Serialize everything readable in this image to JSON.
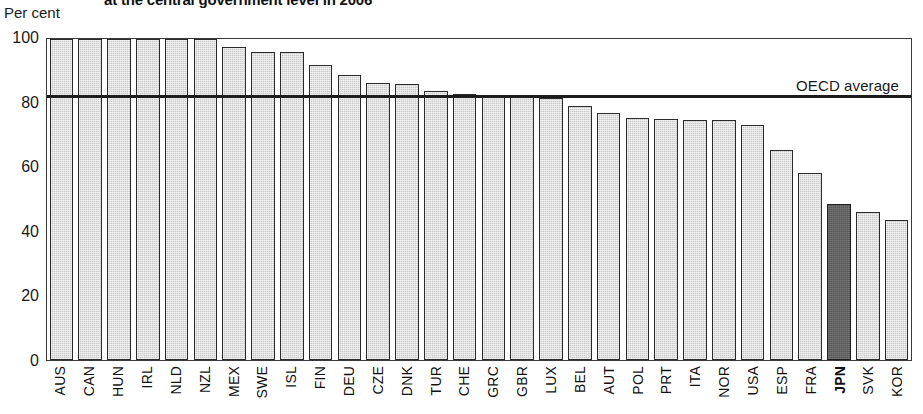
{
  "chart_data": {
    "type": "bar",
    "title": "at the central government level in 2006",
    "units_label": "Per cent",
    "xlabel": "",
    "ylabel": "Per cent",
    "ylim": [
      0,
      100
    ],
    "yticks": [
      0,
      20,
      40,
      60,
      80,
      100
    ],
    "grid": false,
    "legend": "none",
    "highlight_category": "JPN",
    "annotations": [
      {
        "label": "OECD average",
        "type": "reference-line",
        "value": 81.5
      }
    ],
    "categories": [
      "AUS",
      "CAN",
      "HUN",
      "IRL",
      "NLD",
      "NZL",
      "MEX",
      "SWE",
      "ISL",
      "FIN",
      "DEU",
      "CZE",
      "DNK",
      "TUR",
      "CHE",
      "GRC",
      "GBR",
      "LUX",
      "BEL",
      "AUT",
      "POL",
      "PRT",
      "ITA",
      "NOR",
      "USA",
      "ESP",
      "FRA",
      "JPN",
      "SVK",
      "KOR"
    ],
    "values": [
      100,
      100,
      100,
      100,
      100,
      100,
      97.5,
      96.0,
      95.8,
      92.0,
      88.8,
      86.2,
      86.0,
      83.8,
      83.0,
      82.6,
      82.3,
      81.6,
      79.2,
      76.8,
      75.3,
      75.0,
      74.8,
      74.8,
      73.3,
      65.3,
      58.2,
      48.6,
      46.1,
      43.5
    ],
    "bar_colors": {
      "default": "#c9c9c9",
      "highlight": "#585858",
      "border": "#2b2b2b"
    },
    "reference_line_color": "#1c1c1c"
  },
  "header": {
    "title": "at the central government level in 2006",
    "units": "Per cent"
  },
  "axis": {
    "y_ticks": [
      "100",
      "80",
      "60",
      "40",
      "20",
      "0"
    ]
  },
  "annotation": {
    "oecd_average_label": "OECD average"
  }
}
